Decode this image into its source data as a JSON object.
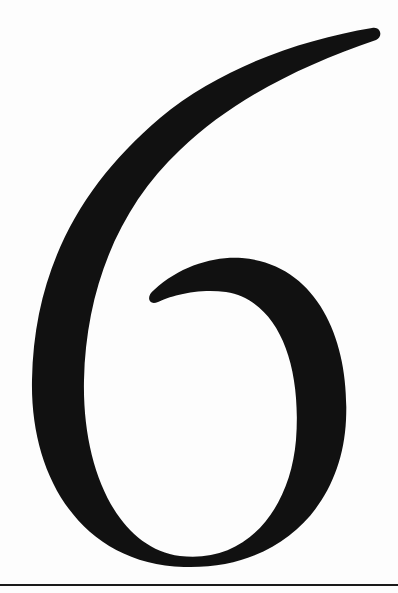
{
  "page": {
    "type": "chapter-opener",
    "chapter_number": "6",
    "ink_color": "#111111",
    "paper_color": "#fdfdfd",
    "rule_color": "#1a1a1a"
  }
}
